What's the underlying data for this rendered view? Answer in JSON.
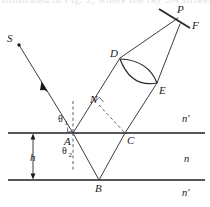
{
  "figure": {
    "top_cropped_text": "illustrated in Fig. 2, where the ray SA strikes",
    "background_color": "#ffffff",
    "ray_color": "#3b3b42",
    "interface_color": "#55555c",
    "label_color": "#1a1a1a"
  },
  "labels": {
    "source": "S",
    "point_a": "A",
    "point_b": "B",
    "point_c": "C",
    "point_d": "D",
    "point_e": "E",
    "point_n": "N",
    "point_p": "P",
    "point_f": "F",
    "height": "h",
    "theta1": "θ",
    "theta1_sub": "1",
    "theta2": "θ",
    "theta2_sub": "2",
    "medium_upper": "n′",
    "medium_middle": "n",
    "medium_lower": "n′"
  },
  "geometry": {
    "interface_upper_y": 133,
    "interface_lower_y": 180,
    "slab_thickness_label": "h",
    "points": {
      "S": [
        17,
        43
      ],
      "A": [
        73,
        133
      ],
      "B": [
        99,
        180
      ],
      "C": [
        125,
        133
      ],
      "N": [
        99,
        105
      ],
      "D": [
        120,
        58
      ],
      "E": [
        157,
        83
      ],
      "P": [
        178,
        17
      ],
      "F": [
        192,
        27
      ]
    }
  },
  "elements": {
    "incident_ray": "S to A with direction arrow",
    "refracted_ray": "A to B inside medium n",
    "internal_reflection": "B to C",
    "emergent_ray_1": "A to D to P",
    "emergent_ray_2": "C to E to P",
    "normal_upper": "dashed vertical normal above A",
    "normal_lower": "dashed vertical normal below A",
    "wavefront_dash": "N to C dashed",
    "lens": "biconvex lens between D and E",
    "screen": "focal screen line through P labelled F"
  }
}
